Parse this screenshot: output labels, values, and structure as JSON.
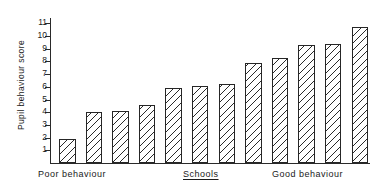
{
  "chart_data": {
    "type": "bar",
    "title": "",
    "xlabel": "Schools",
    "ylabel": "Pupil behaviour score",
    "ylim": [
      0,
      11.5
    ],
    "yticks": [
      1,
      2,
      3,
      4,
      5,
      6,
      7,
      8,
      9,
      10,
      11
    ],
    "ytick_labels": [
      "1",
      "2",
      "3",
      "4",
      "5",
      "6",
      "7",
      "8",
      "9",
      "10",
      "11"
    ],
    "grid": false,
    "legend": null,
    "categories": [
      "1",
      "2",
      "3",
      "4",
      "5",
      "6",
      "7",
      "8",
      "9",
      "10",
      "11",
      "12"
    ],
    "values": [
      1.9,
      4.0,
      4.1,
      4.6,
      5.9,
      6.1,
      6.2,
      7.9,
      8.3,
      9.3,
      9.4,
      10.7
    ],
    "annotations": {
      "x_axis_left": "Poor behaviour",
      "x_axis_center": "Schools",
      "x_axis_right": "Good behaviour"
    },
    "bar_style": {
      "fill": "#ffffff",
      "hatch": "diagonal",
      "edge_color": "#262626"
    }
  },
  "axis": {
    "y_label": "Pupil behaviour score"
  },
  "captions": {
    "left": "Poor  behaviour",
    "middle": "Schools",
    "right": "Good  behaviour"
  }
}
